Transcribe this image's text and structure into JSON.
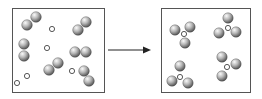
{
  "diagram": {
    "colors": {
      "border": "#555555",
      "sphere_light": "#f4f4f4",
      "sphere_dark": "#5a5a5a",
      "arrow": "#222222"
    },
    "left_panel": {
      "label": "reactants",
      "diatomics": [
        {
          "a": [
            27,
            25
          ],
          "b": [
            36,
            17
          ]
        },
        {
          "a": [
            78,
            30
          ],
          "b": [
            86,
            22
          ]
        },
        {
          "a": [
            24,
            44
          ],
          "b": [
            24,
            56
          ]
        },
        {
          "a": [
            49,
            70
          ],
          "b": [
            58,
            63
          ]
        },
        {
          "a": [
            75,
            52
          ],
          "b": [
            86,
            52
          ]
        },
        {
          "a": [
            84,
            71
          ],
          "b": [
            89,
            81
          ]
        }
      ],
      "atoms": [
        [
          52,
          29
        ],
        [
          47,
          48
        ],
        [
          27,
          76
        ],
        [
          72,
          71
        ],
        [
          17,
          83
        ]
      ]
    },
    "arrow": {
      "from": [
        108,
        50
      ],
      "to": [
        150,
        50
      ]
    },
    "right_panel": {
      "label": "products",
      "molecules": [
        {
          "center": [
            184,
            34
          ],
          "arms": [
            [
              175,
              30
            ],
            [
              190,
              27
            ],
            [
              185,
              43
            ]
          ]
        },
        {
          "center": [
            228,
            28
          ],
          "arms": [
            [
              228,
              18
            ],
            [
              219,
              33
            ],
            [
              236,
              32
            ]
          ]
        },
        {
          "center": [
            180,
            77
          ],
          "arms": [
            [
              180,
              66
            ],
            [
              172,
              81
            ],
            [
              188,
              83
            ]
          ]
        },
        {
          "center": [
            227,
            67
          ],
          "arms": [
            [
              222,
              57
            ],
            [
              236,
              64
            ],
            [
              222,
              76
            ]
          ]
        }
      ]
    }
  }
}
